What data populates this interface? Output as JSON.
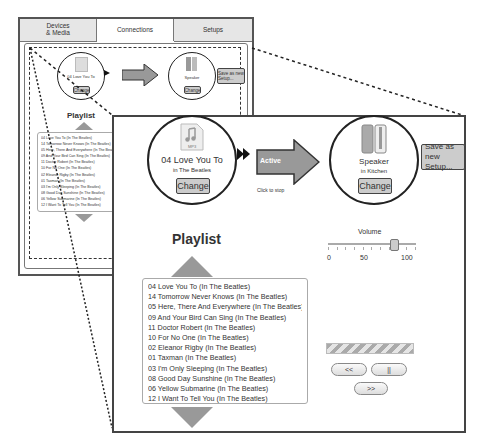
{
  "tabs": [
    {
      "label": "Devices\n& Media",
      "active": false
    },
    {
      "label": "Connections",
      "active": true
    },
    {
      "label": "Setups",
      "active": false
    }
  ],
  "source": {
    "title": "04 Love You To",
    "subtitle": "in The Beatles",
    "icon_label": "MP3",
    "change_label": "Change"
  },
  "connection": {
    "status_label": "Active",
    "hint": "Click to stop"
  },
  "destination": {
    "title": "Speaker",
    "subtitle": "in Kitchen",
    "change_label": "Change"
  },
  "save_setup_label": "Save as new Setup...",
  "playlist": {
    "title": "Playlist",
    "items": [
      "04 Love You To (In The Beatles)",
      "14 Tomorrow Never Knows (In The Beatles)",
      "05 Here, There And Everywhere (In The Beatles)",
      "09 And Your Bird Can Sing (In The Beatles)",
      "11 Doctor Robert (In The Beatles)",
      "10 For No One (In The Beatles)",
      "02 Eleanor Rigby (In The Beatles)",
      "01 Taxman (In The Beatles)",
      "03 I'm Only Sleeping (In The Beatles)",
      "08 Good Day Sunshine (In The Beatles)",
      "06 Yellow Submarine (In The Beatles)",
      "12 I Want To Tell You (In The Beatles)"
    ]
  },
  "volume": {
    "label": "Volume",
    "min": "0",
    "mid": "50",
    "max": "100",
    "value": 78
  },
  "transport": {
    "prev": "<<",
    "pause": "||",
    "next": ">>"
  },
  "colors": {
    "arrow": "#999999",
    "button": "#cccccc",
    "border": "#333333"
  }
}
